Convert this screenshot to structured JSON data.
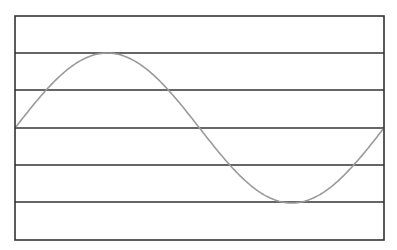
{
  "diagram": {
    "type": "sine-wave-on-staff",
    "frame": {
      "x": 15,
      "y": 16,
      "width": 369,
      "height": 224,
      "stroke": "#333333",
      "stroke_width": 1.6
    },
    "horizontal_lines_y": [
      53,
      90,
      128,
      165,
      202
    ],
    "line_color": "#333333",
    "curve": {
      "color": "#9a9a9a",
      "stroke_width": 1.6,
      "periods": 1,
      "midline_y": 128,
      "amplitude_px": 75,
      "x_start": 15,
      "x_end": 384,
      "peak": {
        "x": 108,
        "y": 53
      },
      "trough": {
        "x": 292,
        "y": 202
      }
    }
  }
}
